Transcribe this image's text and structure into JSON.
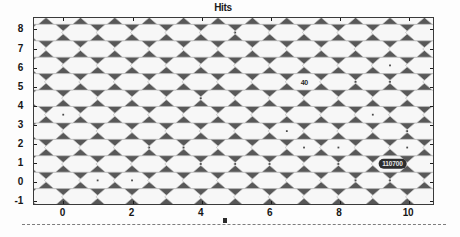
{
  "figure": {
    "title": "Hits",
    "background_color": "#fdfdfd",
    "plot_background_color": "#585858",
    "hex_fill_color": "#f7f7f7",
    "hex_edge_color": "#bdbdbd"
  },
  "axes": {
    "x": {
      "label": "",
      "ticks": [
        "0",
        "2",
        "4",
        "6",
        "8",
        "10"
      ],
      "tick_values": [
        0,
        2,
        4,
        6,
        8,
        10
      ],
      "range": [
        -0.85,
        10.75
      ]
    },
    "y": {
      "label": "",
      "ticks": [
        "-1",
        "0",
        "1",
        "2",
        "3",
        "4",
        "5",
        "6",
        "7",
        "8"
      ],
      "tick_values": [
        -1,
        0,
        1,
        2,
        3,
        4,
        5,
        6,
        7,
        8
      ],
      "range": [
        -1.25,
        8.6
      ]
    }
  },
  "annotations": [
    {
      "name": "bin-count-label",
      "text": "40",
      "x": 7.0,
      "y": 5.2
    }
  ],
  "datatip": {
    "name": "selected-bin-datatip",
    "text": "110700",
    "x": 9.55,
    "y": 0.9
  },
  "ruler": {
    "marker_x": 4.7
  },
  "chart_data": {
    "type": "heatmap",
    "title": "Hits",
    "xlabel": "",
    "ylabel": "",
    "xlim": [
      -0.85,
      10.75
    ],
    "ylim": [
      -1.25,
      8.6
    ],
    "grid": false,
    "legend": "none",
    "bin_shape": "hexagon",
    "hex_radius_x": 0.55,
    "hex_row_spacing": 0.87,
    "columns": 11,
    "rows": 11,
    "points": [
      {
        "x": 0.0,
        "y": 3.48,
        "value": 1
      },
      {
        "x": 1.0,
        "y": 0.0,
        "value": 1
      },
      {
        "x": 2.0,
        "y": 0.0,
        "value": 1
      },
      {
        "x": 2.5,
        "y": 1.74,
        "value": 1
      },
      {
        "x": 3.5,
        "y": 1.74,
        "value": 1
      },
      {
        "x": 4.0,
        "y": 0.87,
        "value": 1
      },
      {
        "x": 4.0,
        "y": 4.35,
        "value": 1
      },
      {
        "x": 5.0,
        "y": 0.87,
        "value": 1
      },
      {
        "x": 5.0,
        "y": 7.83,
        "value": 1
      },
      {
        "x": 6.5,
        "y": 2.61,
        "value": 1
      },
      {
        "x": 6.0,
        "y": 0.87,
        "value": 1
      },
      {
        "x": 7.0,
        "y": 5.22,
        "value": 40
      },
      {
        "x": 7.0,
        "y": 1.74,
        "value": 1
      },
      {
        "x": 8.0,
        "y": 0.87,
        "value": 1
      },
      {
        "x": 8.0,
        "y": 1.74,
        "value": 1
      },
      {
        "x": 8.5,
        "y": 5.22,
        "value": 1
      },
      {
        "x": 8.5,
        "y": 0.0,
        "value": 1
      },
      {
        "x": 9.0,
        "y": 3.48,
        "value": 1
      },
      {
        "x": 9.5,
        "y": 6.09,
        "value": 1
      },
      {
        "x": 9.5,
        "y": 5.22,
        "value": 1
      },
      {
        "x": 9.5,
        "y": 0.87,
        "value": 110700
      },
      {
        "x": 9.5,
        "y": 0.0,
        "value": 1
      },
      {
        "x": 10.0,
        "y": 2.61,
        "value": 1
      },
      {
        "x": 10.0,
        "y": 1.74,
        "value": 1
      }
    ]
  }
}
